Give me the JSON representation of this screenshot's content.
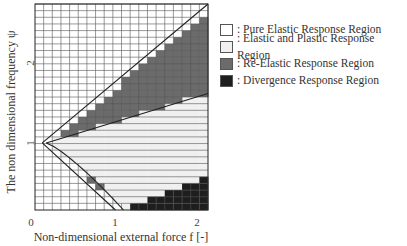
{
  "chart_data": {
    "type": "heatmap",
    "title": "",
    "xlabel": "Non-dimensional external force f [-]",
    "ylabel": "The non dimensional frequency ψ",
    "x_ticks": [
      "0",
      "1",
      "2"
    ],
    "x_tick_values": [
      0,
      1,
      2
    ],
    "y_ticks": [
      "1",
      "2"
    ],
    "y_tick_values": [
      1,
      2
    ],
    "xlim": [
      0,
      2.15
    ],
    "ylim": [
      0.16,
      2.74
    ],
    "grid": {
      "columns": 20,
      "rows": 31,
      "col_step_f": 0.1075,
      "row_step_psi": 0.0833
    },
    "legend_position": "right",
    "regions": [
      {
        "key": "pure_elastic",
        "label": ": Pure Elastic Response Region",
        "color": "#ffffff",
        "pattern": "grid"
      },
      {
        "key": "elastic_plastic",
        "label": ": Elastic and Plastic Response Region",
        "color": "#f0f0f0",
        "pattern": "horizontal-lines"
      },
      {
        "key": "re_elastic",
        "label": ": Re-Elastic Response Region",
        "color": "#6b6b6b",
        "pattern": "solid"
      },
      {
        "key": "divergence",
        "label": ": Divergence Response Region",
        "color": "#1e1e1e",
        "pattern": "solid"
      }
    ],
    "boundaries": {
      "upper_line": {
        "from": [
          0.09,
          1.0
        ],
        "to": [
          2.15,
          2.74
        ]
      },
      "lower_line": {
        "from": [
          0.09,
          1.0
        ],
        "to": [
          1.0,
          0.16
        ]
      },
      "elastic_plastic_upper": {
        "from": [
          0.14,
          1.0
        ],
        "to": [
          2.15,
          1.62
        ]
      },
      "elastic_plastic_lower_curve": {
        "from": [
          0.14,
          1.0
        ],
        "to": [
          1.1,
          0.16
        ]
      },
      "divergence_steps_psi_by_f": [
        [
          1.2,
          0.22
        ],
        [
          1.4,
          0.3
        ],
        [
          1.6,
          0.38
        ],
        [
          1.8,
          0.47
        ],
        [
          2.0,
          0.55
        ]
      ]
    }
  },
  "legend": {
    "items": [
      {
        "label": ": Pure Elastic Response Region"
      },
      {
        "label": ": Elastic and Plastic Response Region"
      },
      {
        "label": ": Re-Elastic Response Region"
      },
      {
        "label": ": Divergence Response Region"
      }
    ]
  },
  "axes": {
    "x_title": "Non-dimensional external force f [-]",
    "y_title": "The non dimensional frequency ψ",
    "x_tick_0": "0",
    "x_tick_1": "1",
    "x_tick_2": "2",
    "y_tick_1": "1",
    "y_tick_2": "2"
  }
}
